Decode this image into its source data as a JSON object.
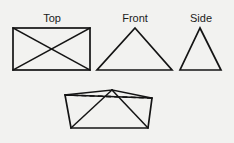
{
  "figure": {
    "background_color": "#f2f2f0",
    "line_color": "#141414",
    "labels": {
      "top": "Top",
      "front": "Front",
      "side": "Side"
    },
    "views": {
      "top": {
        "name": "Top",
        "shape": "rectangle-with-diagonals",
        "label_x": 52,
        "label_y": 22,
        "rect": {
          "x": 13,
          "y": 28,
          "width": 77,
          "height": 42
        },
        "diagonals": [
          {
            "x1": 13,
            "y1": 28,
            "x2": 90,
            "y2": 70
          },
          {
            "x1": 90,
            "y1": 28,
            "x2": 13,
            "y2": 70
          }
        ]
      },
      "front": {
        "name": "Front",
        "shape": "isosceles-triangle",
        "label_x": 135,
        "label_y": 22,
        "points": "135,28 172,70 97,70"
      },
      "side": {
        "name": "Side",
        "shape": "isosceles-triangle",
        "label_x": 201,
        "label_y": 22,
        "points": "200,28 221,70 180,70"
      },
      "pictorial": {
        "name": "Pictorial",
        "shape": "rectangular-pyramid",
        "apex": {
          "x": 112,
          "y": 90
        },
        "base_outline": "65,95 152,98 148,128 71,128",
        "hidden_edge": {
          "x1": 65,
          "y1": 95,
          "x2": 152,
          "y2": 98
        },
        "lateral_edges": [
          {
            "x1": 112,
            "y1": 90,
            "x2": 65,
            "y2": 95
          },
          {
            "x1": 112,
            "y1": 90,
            "x2": 152,
            "y2": 98
          },
          {
            "x1": 112,
            "y1": 90,
            "x2": 71,
            "y2": 128
          },
          {
            "x1": 112,
            "y1": 90,
            "x2": 148,
            "y2": 128
          }
        ]
      }
    }
  }
}
